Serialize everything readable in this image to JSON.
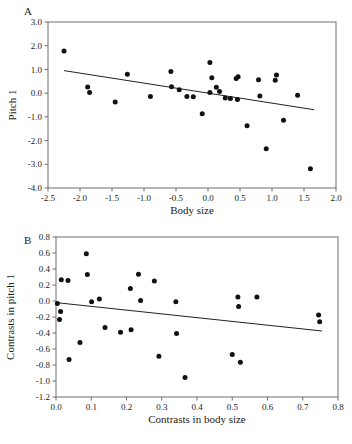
{
  "figure": {
    "width": 352,
    "height": 444,
    "background": "#ffffff",
    "point_color": "#111111",
    "axis_color": "#6f6f6f",
    "line_color": "#222222"
  },
  "panels": [
    {
      "letter": "A"
    },
    {
      "letter": "B"
    }
  ],
  "chart_data": [
    {
      "type": "scatter",
      "panel": "A",
      "title": "",
      "xlabel": "Body size",
      "ylabel": "Pitch 1",
      "xlim": [
        -2.5,
        2.0
      ],
      "ylim": [
        -4.0,
        3.0
      ],
      "grid": false,
      "legend": "none",
      "xticks": [
        -2.5,
        -2.0,
        -1.5,
        -1.0,
        -0.5,
        0.0,
        0.5,
        1.0,
        1.5,
        2.0
      ],
      "xticklabels": [
        "-2.5",
        "-2.0",
        "-1.5",
        "-1.0",
        "-0.5",
        "0.0",
        "0.5",
        "1.0",
        "1.5",
        "2.0"
      ],
      "yticks": [
        -4.0,
        -3.0,
        -2.0,
        -1.0,
        0.0,
        1.0,
        2.0,
        3.0
      ],
      "yticklabels": [
        "-4.0",
        "-3.0",
        "-2.0",
        "-1.0",
        "0.0",
        "1.0",
        "2.0",
        "3.0"
      ],
      "points": [
        [
          -2.25,
          1.78
        ],
        [
          -1.88,
          0.26
        ],
        [
          -1.85,
          0.03
        ],
        [
          -1.45,
          -0.37
        ],
        [
          -1.26,
          0.8
        ],
        [
          -0.9,
          -0.14
        ],
        [
          -0.58,
          0.91
        ],
        [
          -0.57,
          0.27
        ],
        [
          -0.45,
          0.14
        ],
        [
          -0.33,
          -0.14
        ],
        [
          -0.23,
          -0.15
        ],
        [
          -0.09,
          -0.87
        ],
        [
          0.03,
          1.29
        ],
        [
          0.03,
          0.03
        ],
        [
          0.06,
          0.65
        ],
        [
          0.13,
          0.25
        ],
        [
          0.18,
          0.07
        ],
        [
          0.27,
          -0.21
        ],
        [
          0.35,
          -0.23
        ],
        [
          0.44,
          0.62
        ],
        [
          0.47,
          0.69
        ],
        [
          0.46,
          -0.27
        ],
        [
          0.61,
          -1.38
        ],
        [
          0.79,
          0.56
        ],
        [
          0.81,
          -0.12
        ],
        [
          0.91,
          -2.35
        ],
        [
          1.05,
          0.54
        ],
        [
          1.07,
          0.76
        ],
        [
          1.18,
          -1.14
        ],
        [
          1.4,
          -0.09
        ],
        [
          1.6,
          -3.19
        ]
      ],
      "fit_line": {
        "x": [
          -2.25,
          1.66
        ],
        "y": [
          0.95,
          -0.7
        ]
      }
    },
    {
      "type": "scatter",
      "panel": "B",
      "title": "",
      "xlabel": "Contrasts in body size",
      "ylabel": "Contrasts in pitch 1",
      "xlim": [
        0.0,
        0.8
      ],
      "ylim": [
        -1.2,
        0.8
      ],
      "grid": false,
      "legend": "none",
      "xticks": [
        0.0,
        0.1,
        0.2,
        0.3,
        0.4,
        0.5,
        0.6,
        0.7,
        0.8
      ],
      "xticklabels": [
        "0.0",
        "0.1",
        "0.2",
        "0.3",
        "0.4",
        "0.5",
        "0.6",
        "0.7",
        "0.8"
      ],
      "yticks": [
        -1.2,
        -1.0,
        -0.8,
        -0.6,
        -0.4,
        -0.2,
        0.0,
        0.2,
        0.4,
        0.6,
        0.8
      ],
      "yticklabels": [
        "-1.2",
        "-1.0",
        "-0.8",
        "-0.6",
        "-0.4",
        "-0.2",
        "0.0",
        "0.2",
        "0.4",
        "0.6",
        "0.8"
      ],
      "points": [
        [
          0.004,
          -0.03
        ],
        [
          0.01,
          -0.23
        ],
        [
          0.013,
          -0.13
        ],
        [
          0.015,
          0.265
        ],
        [
          0.034,
          0.255
        ],
        [
          0.037,
          -0.73
        ],
        [
          0.068,
          -0.52
        ],
        [
          0.086,
          0.59
        ],
        [
          0.089,
          0.33
        ],
        [
          0.101,
          -0.01
        ],
        [
          0.123,
          0.025
        ],
        [
          0.139,
          -0.33
        ],
        [
          0.183,
          -0.39
        ],
        [
          0.211,
          0.155
        ],
        [
          0.213,
          -0.36
        ],
        [
          0.234,
          0.335
        ],
        [
          0.24,
          0.005
        ],
        [
          0.279,
          0.25
        ],
        [
          0.292,
          -0.69
        ],
        [
          0.34,
          -0.01
        ],
        [
          0.342,
          -0.405
        ],
        [
          0.366,
          -0.955
        ],
        [
          0.5,
          -0.67
        ],
        [
          0.516,
          0.05
        ],
        [
          0.518,
          -0.07
        ],
        [
          0.523,
          -0.765
        ],
        [
          0.57,
          0.05
        ],
        [
          0.745,
          -0.175
        ],
        [
          0.748,
          -0.26
        ]
      ],
      "fit_line": {
        "x": [
          0.0,
          0.755
        ],
        "y": [
          -0.02,
          -0.375
        ]
      }
    }
  ]
}
